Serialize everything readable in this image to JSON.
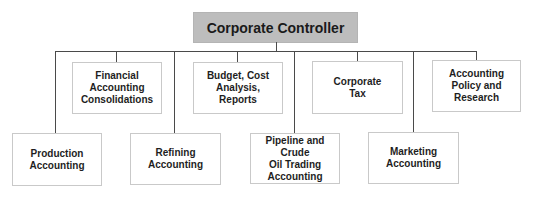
{
  "chart": {
    "root": {
      "label": "Corporate Controller",
      "fill": "#bdbdbd"
    },
    "upper_row": [
      {
        "label": "Financial Accounting\nConsolidations"
      },
      {
        "label": "Budget, Cost\nAnalysis, Reports"
      },
      {
        "label": "Corporate\nTax"
      },
      {
        "label": "Accounting\nPolicy and Research"
      }
    ],
    "lower_row": [
      {
        "label": "Production\nAccounting"
      },
      {
        "label": "Refining Accounting"
      },
      {
        "label": "Pipeline and Crude\nOil Trading\nAccounting"
      },
      {
        "label": "Marketing\nAccounting"
      }
    ]
  }
}
